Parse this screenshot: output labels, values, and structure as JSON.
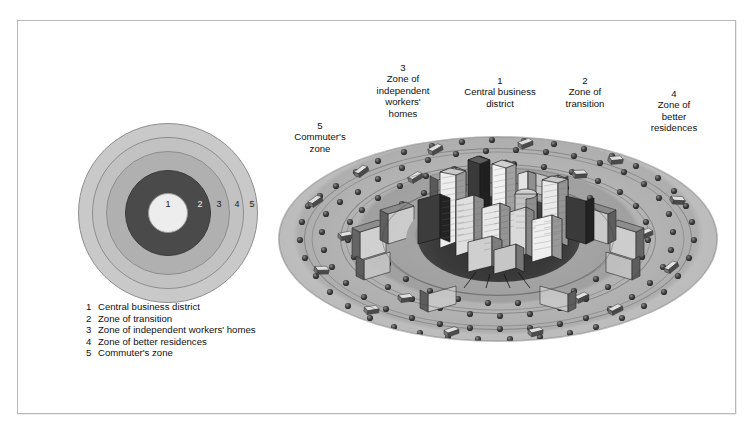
{
  "figure": {
    "frame_color": "#b9b9b9",
    "background": "#ffffff"
  },
  "diagram": {
    "type": "concentric-circles",
    "center_label": "1",
    "ring_numbers": [
      "1",
      "2",
      "3",
      "4",
      "5"
    ],
    "ring_colors": [
      "#ededed",
      "#4a4a4a",
      "#b0b0b0",
      "#c2c2c2",
      "#c9c9c9"
    ],
    "ring_outline": "#8e8e8e"
  },
  "legend": {
    "items": [
      {
        "num": "1",
        "text": "Central business district"
      },
      {
        "num": "2",
        "text": "Zone of transition"
      },
      {
        "num": "3",
        "text": "Zone of independent workers' homes"
      },
      {
        "num": "4",
        "text": "Zone of better residences"
      },
      {
        "num": "5",
        "text": "Commuter's zone"
      }
    ]
  },
  "illustration": {
    "type": "isometric-city-ellipse",
    "callouts": [
      {
        "num": "5",
        "lines": [
          "Commuter's",
          "zone"
        ]
      },
      {
        "num": "3",
        "lines": [
          "Zone of",
          "independent",
          "workers'",
          "homes"
        ]
      },
      {
        "num": "1",
        "lines": [
          "Central business",
          "district"
        ]
      },
      {
        "num": "2",
        "lines": [
          "Zone of",
          "transition"
        ]
      },
      {
        "num": "4",
        "lines": [
          "Zone of",
          "better",
          "residences"
        ]
      }
    ]
  }
}
